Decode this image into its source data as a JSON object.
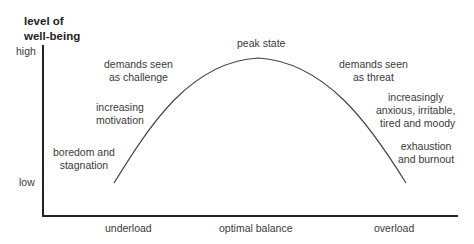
{
  "diagram": {
    "y_axis_title_line1": "level of",
    "y_axis_title_line2": "well-being",
    "y_high": "high",
    "y_low": "low",
    "x_labels": [
      "underload",
      "optimal balance",
      "overload"
    ],
    "curve_labels": {
      "peak": "peak state",
      "left_1": [
        "boredom and",
        "stagnation"
      ],
      "left_2": [
        "increasing",
        "motivation"
      ],
      "left_3": [
        "demands seen",
        "as challenge"
      ],
      "right_3": [
        "demands seen",
        "as threat"
      ],
      "right_2": [
        "increasingly",
        "anxious, irritable,",
        "tired and moody"
      ],
      "right_1": [
        "exhaustion",
        "and burnout"
      ]
    },
    "colors": {
      "axis": "#222222",
      "curve": "#444444",
      "text": "#3a3a3a"
    }
  }
}
